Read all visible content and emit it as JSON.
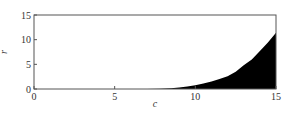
{
  "chart_data": {
    "type": "area",
    "title": "",
    "xlabel": "c",
    "ylabel": "r",
    "xlim": [
      0,
      15
    ],
    "ylim": [
      0,
      15
    ],
    "grid": false,
    "legend": null,
    "x_ticks": [
      0,
      5,
      10,
      15
    ],
    "y_ticks": [
      0,
      5,
      10,
      15
    ],
    "fill_color": "#000000",
    "series": [
      {
        "name": "r(c)",
        "x": [
          0,
          7,
          7.8,
          8.5,
          9,
          9.5,
          10,
          10.5,
          11,
          11.5,
          12,
          12.5,
          13,
          13.5,
          14,
          14.5,
          15
        ],
        "y": [
          0,
          0,
          0.05,
          0.15,
          0.3,
          0.5,
          0.75,
          1.1,
          1.5,
          2.0,
          2.6,
          3.5,
          4.8,
          6.0,
          7.7,
          9.4,
          11.4
        ]
      }
    ]
  }
}
